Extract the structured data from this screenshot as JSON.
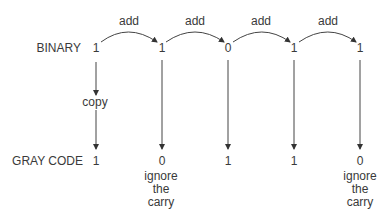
{
  "diagram": {
    "binary_label": "BINARY",
    "gray_label": "GRAY CODE",
    "binary_bits": [
      "1",
      "1",
      "0",
      "1",
      "1"
    ],
    "gray_bits": [
      "1",
      "0",
      "1",
      "1",
      "0"
    ],
    "add_labels": [
      "add",
      "add",
      "add",
      "add"
    ],
    "copy_label": "copy",
    "notes": [
      {
        "index": 1,
        "lines": [
          "ignore",
          "the",
          "carry"
        ]
      },
      {
        "index": 4,
        "lines": [
          "ignore",
          "the",
          "carry"
        ]
      }
    ],
    "colors": {
      "line": "#333333",
      "text": "#3a3a3a"
    }
  }
}
